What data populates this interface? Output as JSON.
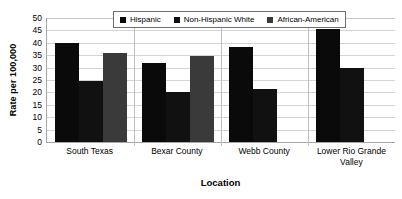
{
  "chart_data": {
    "type": "bar",
    "title": "",
    "xlabel": "Location",
    "ylabel": "Rate per 100,000",
    "ylim": [
      0,
      50
    ],
    "ytick_step": 5,
    "yticks": [
      "50",
      "45",
      "40",
      "35",
      "30",
      "25",
      "20",
      "15",
      "10",
      "5",
      "0"
    ],
    "grid": true,
    "legend_position": "top-center",
    "categories": [
      "South Texas",
      "Bexar County",
      "Webb County",
      "Lower Rio Grande Valley"
    ],
    "series": [
      {
        "name": "Hispanic",
        "color": "#0a0a0a",
        "values": [
          40,
          32,
          38.5,
          45.5
        ]
      },
      {
        "name": "Non-Hispanic White",
        "color": "#111111",
        "values": [
          24.5,
          20,
          21.5,
          30
        ]
      },
      {
        "name": "African-American",
        "color": "#3a3a3a",
        "values": [
          36,
          34.5,
          0,
          0
        ]
      }
    ]
  },
  "legend": {
    "items": [
      {
        "label": "Hispanic"
      },
      {
        "label": "Non-Hispanic White"
      },
      {
        "label": "African-American"
      }
    ]
  }
}
